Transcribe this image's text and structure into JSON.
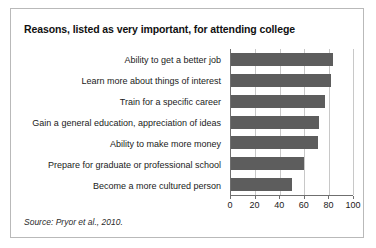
{
  "figure": {
    "title": "Reasons, listed as very important, for attending college",
    "source": "Source: Pryor et al., 2010."
  },
  "chart_data": {
    "type": "bar",
    "orientation": "horizontal",
    "title": "Reasons, listed as very important, for attending college",
    "xlabel": "",
    "ylabel": "",
    "xlim": [
      0,
      100
    ],
    "xticks": [
      0,
      20,
      40,
      60,
      80,
      100
    ],
    "xtick_labels": [
      "0",
      "20",
      "40",
      "60",
      "80",
      "100"
    ],
    "grid": "vertical",
    "legend": "none",
    "bar_color": "#5d5d5d",
    "categories": [
      "Ability to get a better job",
      "Learn more about things of interest",
      "Train for a specific career",
      "Gain a general education, appreciation of ideas",
      "Ability to make more money",
      "Prepare for graduate or professional school",
      "Become a more cultured person"
    ],
    "values": [
      84,
      82,
      77,
      72,
      71,
      60,
      50
    ]
  }
}
